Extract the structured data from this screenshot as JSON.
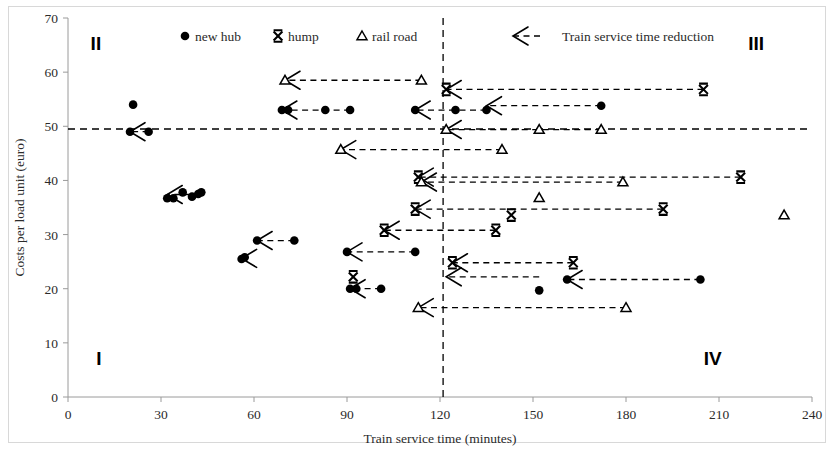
{
  "chart_data": {
    "type": "scatter",
    "title": "",
    "xlabel": "Train service time (minutes)",
    "ylabel": "Costs per load unit (euro)",
    "xlim": [
      0,
      240
    ],
    "ylim": [
      0,
      70
    ],
    "xticks": [
      0,
      30,
      60,
      90,
      120,
      150,
      180,
      210,
      240
    ],
    "yticks": [
      0,
      10,
      20,
      30,
      40,
      50,
      60,
      70
    ],
    "grid": false,
    "legend_position": "top-center",
    "legend": [
      {
        "label": "new hub",
        "marker": "filled-circle"
      },
      {
        "label": "hump",
        "marker": "x-cross"
      },
      {
        "label": "rail road",
        "marker": "open-triangle"
      },
      {
        "label": "Train service time reduction",
        "marker": "dashed-arrow"
      }
    ],
    "reference_lines": [
      {
        "orientation": "horizontal",
        "value": 49.5,
        "style": "dashed",
        "axis": "y"
      },
      {
        "orientation": "vertical",
        "value": 121,
        "style": "dashed",
        "axis": "x"
      }
    ],
    "quadrant_labels": [
      {
        "text": "I",
        "x": 10,
        "y": 6
      },
      {
        "text": "II",
        "x": 9,
        "y": 64
      },
      {
        "text": "III",
        "x": 222,
        "y": 64
      },
      {
        "text": "IV",
        "x": 208,
        "y": 6
      }
    ],
    "series": [
      {
        "name": "new hub",
        "marker": "filled-circle",
        "points": [
          {
            "x": 21,
            "y": 54.0
          },
          {
            "x": 20,
            "y": 49.0
          },
          {
            "x": 26,
            "y": 49.0
          },
          {
            "x": 32,
            "y": 36.7
          },
          {
            "x": 34,
            "y": 36.7
          },
          {
            "x": 37,
            "y": 37.8
          },
          {
            "x": 40,
            "y": 37.0
          },
          {
            "x": 42,
            "y": 37.5
          },
          {
            "x": 43,
            "y": 37.8
          },
          {
            "x": 56,
            "y": 25.5
          },
          {
            "x": 57,
            "y": 25.8
          },
          {
            "x": 61,
            "y": 28.9
          },
          {
            "x": 73,
            "y": 28.9
          },
          {
            "x": 69,
            "y": 53.0
          },
          {
            "x": 71,
            "y": 53.0
          },
          {
            "x": 83,
            "y": 53.0
          },
          {
            "x": 91,
            "y": 53.0
          },
          {
            "x": 90,
            "y": 26.8
          },
          {
            "x": 112,
            "y": 26.8
          },
          {
            "x": 91,
            "y": 20.0
          },
          {
            "x": 93,
            "y": 20.0
          },
          {
            "x": 101,
            "y": 20.0
          },
          {
            "x": 112,
            "y": 53.0
          },
          {
            "x": 125,
            "y": 53.0
          },
          {
            "x": 135,
            "y": 53.0
          },
          {
            "x": 172,
            "y": 53.8
          },
          {
            "x": 152,
            "y": 19.7
          },
          {
            "x": 161,
            "y": 21.7
          },
          {
            "x": 204,
            "y": 21.7
          }
        ]
      },
      {
        "name": "hump",
        "marker": "x-cross",
        "points": [
          {
            "x": 122,
            "y": 56.8
          },
          {
            "x": 205,
            "y": 56.8
          },
          {
            "x": 113,
            "y": 40.6
          },
          {
            "x": 217,
            "y": 40.6
          },
          {
            "x": 112,
            "y": 34.7
          },
          {
            "x": 192,
            "y": 34.7
          },
          {
            "x": 102,
            "y": 30.8
          },
          {
            "x": 138,
            "y": 30.8
          },
          {
            "x": 92,
            "y": 22.2
          },
          {
            "x": 124,
            "y": 24.8
          },
          {
            "x": 163,
            "y": 24.8
          },
          {
            "x": 143,
            "y": 33.6
          }
        ]
      },
      {
        "name": "rail road",
        "marker": "open-triangle",
        "points": [
          {
            "x": 70,
            "y": 58.5
          },
          {
            "x": 114,
            "y": 58.5
          },
          {
            "x": 122,
            "y": 49.4
          },
          {
            "x": 152,
            "y": 49.4
          },
          {
            "x": 172,
            "y": 49.4
          },
          {
            "x": 88,
            "y": 45.7
          },
          {
            "x": 140,
            "y": 45.7
          },
          {
            "x": 114,
            "y": 39.7
          },
          {
            "x": 179,
            "y": 39.7
          },
          {
            "x": 152,
            "y": 36.8
          },
          {
            "x": 231,
            "y": 33.6
          },
          {
            "x": 113,
            "y": 16.5
          },
          {
            "x": 180,
            "y": 16.5
          }
        ]
      }
    ],
    "reduction_arrows": [
      {
        "series": "rail road",
        "from_x": 114,
        "to_x": 70,
        "y": 58.5
      },
      {
        "series": "hump",
        "from_x": 205,
        "to_x": 122,
        "y": 56.8
      },
      {
        "series": "new hub",
        "from_x": 91,
        "to_x": 69,
        "y": 53.0
      },
      {
        "series": "new hub",
        "from_x": 135,
        "to_x": 112,
        "y": 53.0
      },
      {
        "series": "new hub",
        "from_x": 172,
        "to_x": 135,
        "y": 53.8
      },
      {
        "series": "rail road",
        "from_x": 172,
        "to_x": 122,
        "y": 49.4
      },
      {
        "series": "new hub",
        "from_x": 26,
        "to_x": 20,
        "y": 49.0
      },
      {
        "series": "rail road",
        "from_x": 140,
        "to_x": 88,
        "y": 45.7
      },
      {
        "series": "hump",
        "from_x": 217,
        "to_x": 113,
        "y": 40.6
      },
      {
        "series": "rail road",
        "from_x": 179,
        "to_x": 114,
        "y": 39.7
      },
      {
        "series": "hump",
        "from_x": 192,
        "to_x": 112,
        "y": 34.7
      },
      {
        "series": "new hub",
        "from_x": 43,
        "to_x": 32,
        "y": 37.4
      },
      {
        "series": "hump",
        "from_x": 138,
        "to_x": 102,
        "y": 30.8
      },
      {
        "series": "new hub",
        "from_x": 73,
        "to_x": 61,
        "y": 28.9
      },
      {
        "series": "new hub",
        "from_x": 57,
        "to_x": 56,
        "y": 25.6
      },
      {
        "series": "new hub",
        "from_x": 112,
        "to_x": 90,
        "y": 26.8
      },
      {
        "series": "hump",
        "from_x": 163,
        "to_x": 124,
        "y": 24.8
      },
      {
        "series": "new hub",
        "from_x": 204,
        "to_x": 161,
        "y": 21.7
      },
      {
        "series": "new hub",
        "from_x": 101,
        "to_x": 91,
        "y": 20.0
      },
      {
        "series": "rail road",
        "from_x": 180,
        "to_x": 113,
        "y": 16.5
      },
      {
        "series": "hump",
        "from_x": 152,
        "to_x": 122,
        "y": 22.2
      }
    ]
  },
  "labels": {
    "xticks": [
      "0",
      "30",
      "60",
      "90",
      "120",
      "150",
      "180",
      "210",
      "240"
    ],
    "yticks": [
      "0",
      "10",
      "20",
      "30",
      "40",
      "50",
      "60",
      "70"
    ],
    "xlabel": "Train service time (minutes)",
    "ylabel": "Costs per load unit (euro)",
    "legend_new_hub": "new hub",
    "legend_hump": "hump",
    "legend_rail_road": "rail road",
    "legend_reduction": "Train service time reduction",
    "quad_I": "I",
    "quad_II": "II",
    "quad_III": "III",
    "quad_IV": "IV"
  },
  "colors": {
    "ink": "#000000",
    "axis": "#9a9a9a",
    "background": "#ffffff"
  }
}
